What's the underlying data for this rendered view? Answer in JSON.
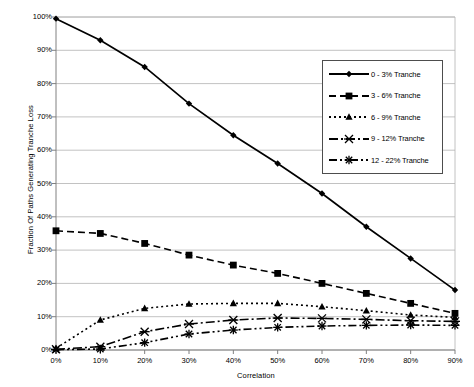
{
  "chart_data": {
    "type": "line",
    "title": "",
    "xlabel": "Correlation",
    "ylabel": "Fraction Of Paths Generating Tranche Loss",
    "x": [
      0,
      10,
      20,
      30,
      40,
      50,
      60,
      70,
      80,
      90
    ],
    "xticklabels": [
      "0%",
      "10%",
      "20%",
      "30%",
      "40%",
      "50%",
      "60%",
      "70%",
      "80%",
      "90%"
    ],
    "yticklabels": [
      "0%",
      "10%",
      "20%",
      "30%",
      "40%",
      "50%",
      "60%",
      "70%",
      "80%",
      "90%",
      "100%"
    ],
    "xlim": [
      0,
      90
    ],
    "ylim": [
      0,
      100
    ],
    "grid": true,
    "legend_position": "upper right",
    "series": [
      {
        "name": "0 - 3% Tranche",
        "marker": "diamond",
        "dash": "solid",
        "values": [
          99.5,
          93.0,
          85.0,
          74.0,
          64.5,
          56.0,
          47.0,
          37.0,
          27.5,
          18.0
        ]
      },
      {
        "name": "3 - 6% Tranche",
        "marker": "square",
        "dash": "dashed",
        "values": [
          35.8,
          35.0,
          32.0,
          28.5,
          25.5,
          23.0,
          20.0,
          17.0,
          14.0,
          11.0
        ]
      },
      {
        "name": "6 - 9% Tranche",
        "marker": "triangle",
        "dash": "dotted",
        "values": [
          0.5,
          9.0,
          12.5,
          13.8,
          14.0,
          14.0,
          13.0,
          11.8,
          10.5,
          9.8
        ]
      },
      {
        "name": "9 - 12% Tranche",
        "marker": "x",
        "dash": "dashdot",
        "values": [
          0.2,
          1.0,
          5.5,
          7.8,
          9.0,
          9.6,
          9.5,
          9.2,
          8.8,
          8.6
        ]
      },
      {
        "name": "12 - 22% Tranche",
        "marker": "asterisk",
        "dash": "dashdotdot",
        "values": [
          0.1,
          0.3,
          2.2,
          4.8,
          6.0,
          6.8,
          7.2,
          7.4,
          7.5,
          7.4
        ]
      }
    ],
    "colors": {
      "series": "#000000",
      "grid": "#b3b3b3",
      "axis": "#808080",
      "background": "#ffffff"
    }
  },
  "legend": {
    "items": [
      {
        "label": "0 - 3% Tranche"
      },
      {
        "label": "3 - 6% Tranche"
      },
      {
        "label": "6 - 9% Tranche"
      },
      {
        "label": "9 - 12% Tranche"
      },
      {
        "label": "12 - 22% Tranche"
      }
    ]
  }
}
